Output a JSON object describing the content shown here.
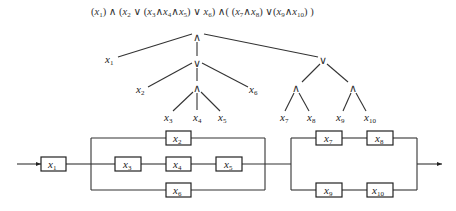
{
  "formula": {
    "text": "(x1) ∧ (x2 ∨ (x3∧x4∧x5) ∨ x6) ∧( (x7∧x8) ∨(x9∧x10) )"
  },
  "tree": {
    "root": {
      "op": "∧",
      "x": 197,
      "y": 38
    },
    "nodes": [
      {
        "id": "and_root",
        "op": "∧",
        "x": 197,
        "y": 38
      },
      {
        "id": "or_left",
        "op": "∨",
        "x": 197,
        "y": 63
      },
      {
        "id": "and_mid",
        "op": "∧",
        "x": 197,
        "y": 88
      },
      {
        "id": "or_right",
        "op": "∨",
        "x": 323,
        "y": 60
      },
      {
        "id": "and_78",
        "op": "∧",
        "x": 296,
        "y": 89
      },
      {
        "id": "and_910",
        "op": "∧",
        "x": 353,
        "y": 89
      }
    ],
    "leaves": [
      {
        "var": "x",
        "sub": "1",
        "x": 106,
        "y": 63
      },
      {
        "var": "x",
        "sub": "2",
        "x": 137,
        "y": 93
      },
      {
        "var": "x",
        "sub": "6",
        "x": 252,
        "y": 93
      },
      {
        "var": "x",
        "sub": "3",
        "x": 164,
        "y": 119
      },
      {
        "var": "x",
        "sub": "4",
        "x": 193,
        "y": 119
      },
      {
        "var": "x",
        "sub": "5",
        "x": 218,
        "y": 119
      },
      {
        "var": "x",
        "sub": "7",
        "x": 280,
        "y": 119
      },
      {
        "var": "x",
        "sub": "8",
        "x": 307,
        "y": 119
      },
      {
        "var": "x",
        "sub": "9",
        "x": 336,
        "y": 119
      },
      {
        "var": "x",
        "sub": "10",
        "x": 366,
        "y": 119
      }
    ]
  },
  "circuit": {
    "boxes": [
      {
        "label_var": "x",
        "label_sub": "1",
        "x": 41,
        "y": 157
      },
      {
        "label_var": "x",
        "label_sub": "2",
        "x": 166,
        "y": 131
      },
      {
        "label_var": "x",
        "label_sub": "3",
        "x": 115,
        "y": 157
      },
      {
        "label_var": "x",
        "label_sub": "4",
        "x": 166,
        "y": 157
      },
      {
        "label_var": "x",
        "label_sub": "5",
        "x": 216,
        "y": 157
      },
      {
        "label_var": "x",
        "label_sub": "6",
        "x": 166,
        "y": 183
      },
      {
        "label_var": "x",
        "label_sub": "7",
        "x": 316,
        "y": 131
      },
      {
        "label_var": "x",
        "label_sub": "8",
        "x": 367,
        "y": 131
      },
      {
        "label_var": "x",
        "label_sub": "9",
        "x": 316,
        "y": 183
      },
      {
        "label_var": "x",
        "label_sub": "10",
        "x": 367,
        "y": 183
      }
    ]
  }
}
